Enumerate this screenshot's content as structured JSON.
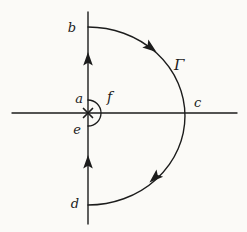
{
  "diagram": {
    "labels": {
      "top_point": "b",
      "indent_top_point": "a",
      "indent_bottom_point": "e",
      "indent_arc": "f",
      "axis_crossing_point": "c",
      "bottom_point": "d",
      "large_arc": "Γ"
    },
    "icons": {
      "pole_marker": "×",
      "direction_marker": "solid-triangle-arrowhead"
    },
    "colors": {
      "background": "#fbfaf7",
      "ink": "#1c1c1c"
    }
  }
}
